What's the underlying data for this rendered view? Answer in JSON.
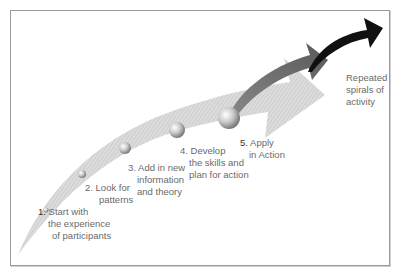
{
  "diagram": {
    "steps": [
      {
        "num": "1.",
        "lines": [
          "Start with",
          "the experience",
          "of participants"
        ]
      },
      {
        "num": "2.",
        "lines": [
          "Look for",
          "patterns"
        ]
      },
      {
        "num": "3.",
        "lines": [
          "Add in new",
          "information",
          "and theory"
        ]
      },
      {
        "num": "4.",
        "lines": [
          "Develop",
          "the skills and",
          "plan for action"
        ]
      },
      {
        "num": "5.",
        "lines": [
          "Apply",
          "in Action"
        ]
      }
    ],
    "spiral_label": [
      "Repeated",
      "spirals of",
      "activity"
    ],
    "colors": {
      "main_arrow": "#d4d4d4",
      "second_arrow": "#6e6e6e",
      "third_arrow": "#111111",
      "frame": "#9a9a9a",
      "text": "#6a6a6a"
    }
  }
}
